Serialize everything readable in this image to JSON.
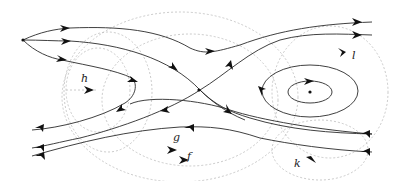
{
  "diagram": {
    "type": "phase-portrait",
    "colors": {
      "flow_line": "#2a2a2a",
      "dashed_circle": "#bdbdbd",
      "arrow": "#111111",
      "background": "#ffffff"
    },
    "labels": [
      {
        "id": "h",
        "text": "h"
      },
      {
        "id": "g",
        "text": "g"
      },
      {
        "id": "f",
        "text": "f"
      },
      {
        "id": "k",
        "text": "k"
      },
      {
        "id": "l",
        "text": "l"
      }
    ],
    "critical_points": [
      {
        "name": "source",
        "kind": "node"
      },
      {
        "name": "saddle",
        "kind": "saddle"
      },
      {
        "name": "center",
        "kind": "center"
      }
    ]
  }
}
